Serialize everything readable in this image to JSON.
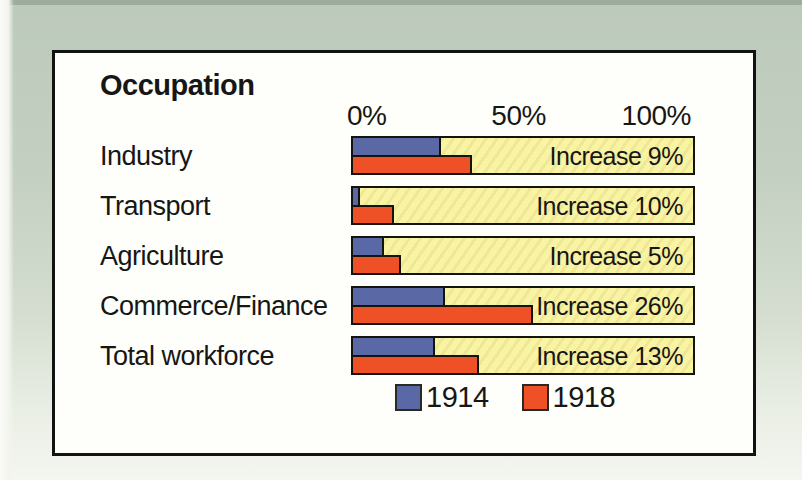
{
  "page_background": {
    "top_color": "#c3cfc1",
    "bottom_color": "#f4f6f0"
  },
  "panel": {
    "background": "#fefefb",
    "border_color": "#121210"
  },
  "chart_data": {
    "type": "bar",
    "orientation": "horizontal",
    "title": "Occupation",
    "categories": [
      "Industry",
      "Transport",
      "Agriculture",
      "Commerce/Finance",
      "Total workforce"
    ],
    "series": [
      {
        "name": "1914",
        "color": "#5b68a6",
        "values": [
          26,
          2,
          9,
          27,
          24
        ]
      },
      {
        "name": "1918",
        "color": "#ee5125",
        "values": [
          35,
          12,
          14,
          53,
          37
        ]
      }
    ],
    "annotations": [
      "Increase 9%",
      "Increase 10%",
      "Increase 5%",
      "Increase 26%",
      "Increase 13%"
    ],
    "x_axis": {
      "min": 0,
      "max": 100,
      "ticks": [
        "0%",
        "50%",
        "100%"
      ]
    },
    "track_color": "#f9f3a4",
    "grid": false,
    "legend_position": "bottom"
  }
}
